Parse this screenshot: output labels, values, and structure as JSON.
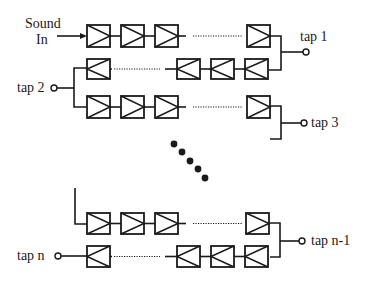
{
  "diagram": {
    "colors": {
      "ink": "#1a1a1a",
      "background": "#ffffff"
    },
    "labels": {
      "sound": "Sound",
      "in": "In",
      "tap1": "tap 1",
      "tap2": "tap 2",
      "tap3": "tap 3",
      "tapn1": "tap n-1",
      "tapn": "tap n"
    },
    "rows": [
      {
        "id": "row1",
        "direction": "forward",
        "y": 25,
        "h": 22,
        "boxes_x": [
          87,
          121,
          155,
          247
        ],
        "dotted": [
          193,
          242
        ]
      },
      {
        "id": "row2",
        "direction": "reverse",
        "y": 59,
        "h": 20,
        "boxes_x": [
          87,
          177,
          211,
          245
        ],
        "dotted": [
          114,
          160
        ]
      },
      {
        "id": "row3",
        "direction": "forward",
        "y": 96,
        "h": 22,
        "boxes_x": [
          87,
          121,
          155,
          247
        ],
        "dotted": [
          193,
          242
        ]
      },
      {
        "id": "row4",
        "direction": "forward",
        "y": 213,
        "h": 21,
        "boxes_x": [
          87,
          121,
          155,
          246
        ],
        "dotted": [
          193,
          242
        ]
      },
      {
        "id": "row5",
        "direction": "reverse",
        "y": 246,
        "h": 21,
        "boxes_x": [
          87,
          177,
          211,
          245
        ],
        "dotted": [
          114,
          160
        ]
      }
    ],
    "taps": [
      {
        "name": "tap1",
        "cx": 306,
        "cy": 52
      },
      {
        "name": "tap2",
        "cx": 54,
        "cy": 88
      },
      {
        "name": "tap3",
        "cx": 304,
        "cy": 123
      },
      {
        "name": "tapn1",
        "cx": 302,
        "cy": 241
      },
      {
        "name": "tapn",
        "cx": 58,
        "cy": 256
      }
    ],
    "ellipsis_dots": [
      [
        174,
        144
      ],
      [
        182,
        152
      ],
      [
        190,
        161
      ],
      [
        198,
        169
      ],
      [
        205,
        178
      ]
    ]
  }
}
